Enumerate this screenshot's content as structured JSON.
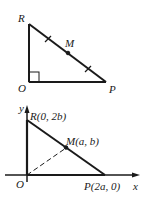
{
  "figure_top": {
    "labels": {
      "R": "R",
      "M": "M",
      "O": "O",
      "P": "P"
    }
  },
  "figure_bottom": {
    "labels": {
      "y_axis": "y",
      "x_axis": "x",
      "R": "R(0, 2b)",
      "M": "M(a, b)",
      "O": "O",
      "P": "P(2a, 0)"
    }
  },
  "colors": {
    "stroke": "#1a1a1a",
    "background": "#ffffff"
  }
}
